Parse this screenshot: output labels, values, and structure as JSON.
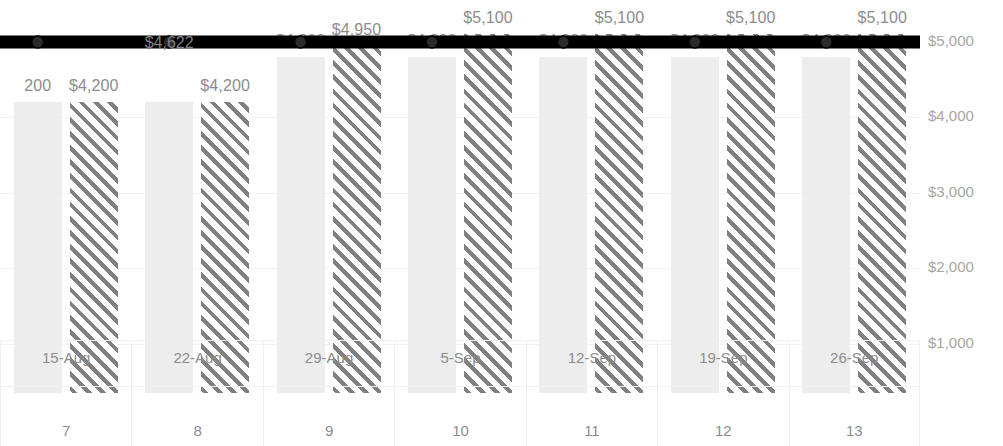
{
  "chart_data": {
    "type": "bar",
    "title": "",
    "subtitle": "",
    "xlabel": "",
    "ylabel": "",
    "categories": [
      "15-Aug",
      "22-Aug",
      "29-Aug",
      "5-Sep",
      "12-Sep",
      "19-Sep",
      "26-Sep"
    ],
    "category_sublabels": [
      "7",
      "8",
      "9",
      "10",
      "11",
      "12",
      "13"
    ],
    "ylim": [
      0,
      5500
    ],
    "yticks": [
      0,
      1000,
      2000,
      3000,
      4000,
      5000
    ],
    "ytick_labels": [
      "$-",
      "$1,000",
      "$2,000",
      "$3,000",
      "$4,000",
      "$5,000"
    ],
    "y_axis_position": "right",
    "grid": true,
    "legend": "none",
    "cropped": true,
    "series": [
      {
        "name": "series-1-solid",
        "style": "solid-light-gray",
        "values": [
          4200,
          4200,
          4800,
          4800,
          4800,
          4800,
          4800
        ],
        "labels": [
          "200",
          "",
          "$4,800",
          "$4,800",
          "$4,800",
          "$4,800",
          "$4,800"
        ]
      },
      {
        "name": "series-2-hatched",
        "style": "diagonal-hatch-gray",
        "values": [
          4200,
          4200,
          4950,
          5100,
          5100,
          5100,
          5100
        ],
        "labels": [
          "$4,200",
          "$4,200",
          "$4,950",
          "$5,100",
          "$5,100",
          "$5,100",
          "$5,100"
        ]
      },
      {
        "name": "line-series",
        "style": "thick-black-line-circle-markers",
        "values": [
          5000,
          5000,
          5000,
          5000,
          5000,
          5000,
          5000
        ],
        "labels": [
          "",
          "$4,622",
          "",
          "",
          "",
          "",
          ""
        ]
      }
    ]
  },
  "colors": {
    "solid_bar": "#ededed",
    "hatch_bar": "#808080",
    "line": "#000000",
    "gridline": "#f2f2f2",
    "label_text": "#8c8c8c",
    "axis_text": "#a6a6a6"
  }
}
